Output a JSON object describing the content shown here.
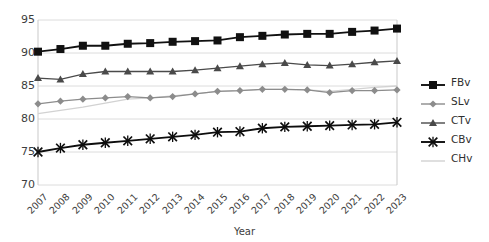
{
  "title_clipped": "",
  "axis": {
    "xlabel": "Year",
    "ylabel": "",
    "yticks": [
      "95",
      "90",
      "85",
      "80",
      "75",
      "70"
    ],
    "xticks": [
      "2007",
      "2008",
      "2009",
      "2010",
      "2011",
      "2012",
      "2013",
      "2014",
      "2015",
      "2016",
      "2017",
      "2018",
      "2019",
      "2020",
      "2021",
      "2022",
      "2023"
    ]
  },
  "legend": {
    "items": [
      {
        "label": "FBv",
        "color": "#111111",
        "marker": "square"
      },
      {
        "label": "SLv",
        "color": "#8c8c8c",
        "marker": "diamond"
      },
      {
        "label": "CTv",
        "color": "#4a4a4a",
        "marker": "triangle"
      },
      {
        "label": "CBv",
        "color": "#0d0d0d",
        "marker": "cross"
      },
      {
        "label": "CHv",
        "color": "#d2d2d2",
        "marker": "none"
      }
    ]
  },
  "chart_data": {
    "type": "line",
    "title": "",
    "xlabel": "Year",
    "ylabel": "",
    "ylim": [
      70,
      95
    ],
    "grid": true,
    "legend_position": "right",
    "x": [
      "2007",
      "2008",
      "2009",
      "2010",
      "2011",
      "2012",
      "2013",
      "2014",
      "2015",
      "2016",
      "2017",
      "2018",
      "2019",
      "2020",
      "2021",
      "2022",
      "2023"
    ],
    "series": [
      {
        "name": "FBv",
        "color": "#111111",
        "marker": "square",
        "values": [
          90.2,
          90.6,
          91.1,
          91.1,
          91.4,
          91.5,
          91.7,
          91.8,
          91.9,
          92.4,
          92.6,
          92.8,
          92.9,
          92.9,
          93.2,
          93.4,
          93.7
        ]
      },
      {
        "name": "SLv",
        "color": "#8c8c8c",
        "marker": "diamond",
        "values": [
          82.3,
          82.7,
          83.0,
          83.2,
          83.4,
          83.2,
          83.4,
          83.8,
          84.2,
          84.3,
          84.5,
          84.5,
          84.4,
          84.0,
          84.3,
          84.3,
          84.4
        ]
      },
      {
        "name": "CTv",
        "color": "#4a4a4a",
        "marker": "triangle",
        "values": [
          86.2,
          86.0,
          86.8,
          87.2,
          87.2,
          87.2,
          87.2,
          87.4,
          87.7,
          88.0,
          88.3,
          88.5,
          88.2,
          88.1,
          88.3,
          88.6,
          88.8
        ]
      },
      {
        "name": "CBv",
        "color": "#0d0d0d",
        "marker": "cross",
        "values": [
          75.0,
          75.6,
          76.1,
          76.4,
          76.7,
          77.0,
          77.3,
          77.6,
          78.0,
          78.1,
          78.6,
          78.8,
          78.9,
          79.0,
          79.1,
          79.2,
          79.5
        ]
      },
      {
        "name": "CHv",
        "color": "#d2d2d2",
        "marker": "none",
        "values": [
          80.8,
          81.3,
          81.8,
          82.4,
          83.0,
          83.2,
          83.5,
          83.8,
          84.2,
          84.3,
          84.5,
          84.5,
          84.4,
          84.2,
          84.5,
          84.8,
          85.0
        ]
      }
    ]
  }
}
